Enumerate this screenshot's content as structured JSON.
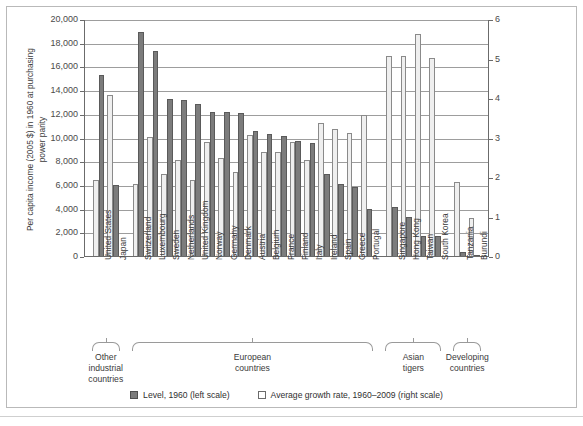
{
  "axes": {
    "left_title": "Per capita income (2005 $) in 1960 at purchasing power parity",
    "left_title_l1": "Per capita income (2005 $) in 1960 at purchasing",
    "left_title_l2": "power parity",
    "right_title": "Average growth rate, 1960–2009 in %",
    "left_ticks": [
      "20,000",
      "18,000",
      "16,000",
      "14,000",
      "12,000",
      "10,000",
      "8,000",
      "6,000",
      "4,000",
      "2,000",
      "0"
    ],
    "right_ticks": [
      "6",
      "5",
      "4",
      "3",
      "2",
      "1",
      "0"
    ]
  },
  "legend": {
    "level_label": "Level, 1960 (left scale)",
    "growth_label": "Average growth rate, 1960–2009 (right scale)",
    "level_color": "#7c7c7c",
    "growth_color": "#efefef"
  },
  "groups": [
    {
      "label_l1": "Other",
      "label_l2": "industrial",
      "label_l3": "countries",
      "start": 0,
      "end": 1
    },
    {
      "label_l1": "European",
      "label_l2": "countries",
      "label_l3": "",
      "start": 2,
      "end": 15
    },
    {
      "label_l1": "Asian",
      "label_l2": "tigers",
      "label_l3": "",
      "start": 16,
      "end": 19
    },
    {
      "label_l1": "Developing",
      "label_l2": "countries",
      "label_l3": "",
      "start": 20,
      "end": 21
    }
  ],
  "chart_data": {
    "type": "bar",
    "title": "",
    "xlabel": "",
    "ylabel": "Per capita income (2005 $) in 1960 at purchasing power parity",
    "y2label": "Average growth rate, 1960–2009 in %",
    "ylim": [
      0,
      20000
    ],
    "y2lim": [
      0,
      6
    ],
    "grid": true,
    "legend_position": "bottom",
    "categories": [
      "United States",
      "Japan",
      "Switzerland",
      "Luxembourg",
      "Sweden",
      "Netherlands",
      "United Kingdom",
      "Norway",
      "Germany",
      "Denmark",
      "Austria",
      "Belgium",
      "France",
      "Finland",
      "Italy",
      "Ireland",
      "Spain",
      "Greece",
      "Portugal",
      "Singapore",
      "Hong Kong",
      "Taiwan",
      "South Korea",
      "Tanzania",
      "Burundi"
    ],
    "series": [
      {
        "name": "Level, 1960 (left scale)",
        "axis": "left",
        "units": "2005 $ PPP",
        "values": [
          15400,
          6100,
          18950,
          17400,
          13350,
          13250,
          12900,
          12250,
          12250,
          12150,
          10650,
          10400,
          10200,
          9750,
          9600,
          7000,
          6200,
          5950,
          4050,
          4200,
          3400,
          1800,
          1800,
          450,
          200
        ]
      },
      {
        "name": "Average growth rate, 1960–2009 (right scale)",
        "axis": "right",
        "units": "%",
        "values": [
          1.95,
          4.1,
          1.85,
          3.05,
          2.1,
          2.45,
          1.95,
          2.9,
          2.5,
          2.15,
          3.1,
          2.65,
          2.65,
          2.9,
          2.45,
          3.4,
          3.25,
          3.15,
          3.6,
          5.1,
          5.1,
          5.65,
          5.05,
          1.9,
          1.0
        ]
      }
    ],
    "levels_by_country": [
      {
        "country": "United States",
        "level": 15400,
        "growth": 1.95
      },
      {
        "country": "Japan",
        "level": 6100,
        "growth": 4.1
      },
      {
        "country": "Switzerland",
        "level": 18950,
        "growth": 1.85
      },
      {
        "country": "Luxembourg",
        "level": 17400,
        "growth": 3.05
      },
      {
        "country": "Sweden",
        "level": 13350,
        "growth": 2.1
      },
      {
        "country": "Netherlands",
        "level": 13250,
        "growth": 2.45
      },
      {
        "country": "United Kingdom",
        "level": 12900,
        "growth": 1.95
      },
      {
        "country": "Norway",
        "level": 12250,
        "growth": 2.9
      },
      {
        "country": "Germany",
        "level": 12250,
        "growth": 2.5
      },
      {
        "country": "Denmark",
        "level": 12150,
        "growth": 2.15
      },
      {
        "country": "Austria",
        "level": 10650,
        "growth": 3.1
      },
      {
        "country": "Belgium",
        "level": 10400,
        "growth": 2.65
      },
      {
        "country": "France",
        "level": 10200,
        "growth": 2.65
      },
      {
        "country": "Finland",
        "level": 9750,
        "growth": 2.9
      },
      {
        "country": "Italy",
        "level": 9600,
        "growth": 2.45
      },
      {
        "country": "Ireland",
        "level": 7000,
        "growth": 3.4
      },
      {
        "country": "Spain",
        "level": 6200,
        "growth": 3.25
      },
      {
        "country": "Greece",
        "level": 5950,
        "growth": 3.15
      },
      {
        "country": "Portugal",
        "level": 4050,
        "growth": 3.6
      },
      {
        "country": "Singapore",
        "level": 4200,
        "growth": 5.1
      },
      {
        "country": "Hong Kong",
        "level": 3400,
        "growth": 5.1
      },
      {
        "country": "Taiwan",
        "level": 1800,
        "growth": 5.65
      },
      {
        "country": "South Korea",
        "level": 1800,
        "growth": 5.05
      },
      {
        "country": "Tanzania",
        "level": 450,
        "growth": 1.9
      },
      {
        "country": "Burundi",
        "level": 200,
        "growth": 1.0
      }
    ]
  }
}
